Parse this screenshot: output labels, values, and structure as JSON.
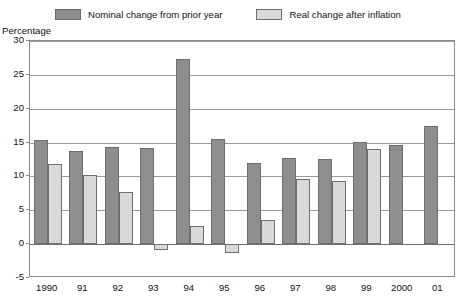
{
  "legend": {
    "items": [
      {
        "label": "Nominal change from prior year",
        "color": "#8e8e8e",
        "key": "nominal"
      },
      {
        "label": "Real change after inflation",
        "color": "#d9d9d9",
        "key": "real"
      }
    ]
  },
  "axis_title": "Percentage",
  "chart_data": {
    "type": "bar",
    "title": "",
    "subtitle": "",
    "xlabel": "",
    "ylabel": "Percentage",
    "ylim": [
      -5,
      30
    ],
    "yticks": [
      -5,
      0,
      5,
      10,
      15,
      20,
      25,
      30
    ],
    "grid": true,
    "legend_position": "top-center",
    "categories": [
      "1990",
      "91",
      "92",
      "93",
      "94",
      "95",
      "96",
      "97",
      "98",
      "99",
      "2000",
      "01"
    ],
    "series": [
      {
        "name": "Nominal change from prior year",
        "color": "#8e8e8e",
        "values": [
          15.4,
          13.8,
          14.4,
          14.2,
          27.3,
          15.5,
          12.0,
          12.7,
          12.6,
          15.1,
          14.6,
          17.4
        ]
      },
      {
        "name": "Real change after inflation",
        "color": "#d9d9d9",
        "values": [
          11.9,
          10.2,
          7.7,
          -0.8,
          2.7,
          -1.3,
          3.5,
          9.6,
          9.3,
          14.0,
          null,
          null
        ]
      }
    ]
  }
}
